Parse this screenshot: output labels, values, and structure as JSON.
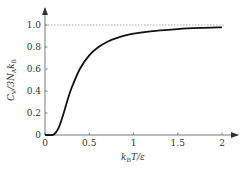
{
  "chart_data": {
    "type": "line",
    "title": "",
    "xlabel": "k_B T/ε",
    "ylabel": "C_V/3N_A k_B",
    "xlim": [
      0,
      2
    ],
    "ylim": [
      0,
      1.0
    ],
    "xticks": [
      0,
      0.5,
      1,
      1.5,
      2
    ],
    "xtick_labels": [
      "0",
      "0.5",
      "1",
      "1.5",
      "2"
    ],
    "yticks": [
      0,
      0.2,
      0.4,
      0.6,
      0.8,
      1.0
    ],
    "ytick_labels": [
      "0",
      "0.2",
      "0.4",
      "0.6",
      "0.8",
      "1.0"
    ],
    "grid": false,
    "reference_line": {
      "y": 1.0,
      "style": "dotted"
    },
    "series": [
      {
        "name": "heat capacity",
        "x": [
          0,
          0.05,
          0.1,
          0.15,
          0.2,
          0.25,
          0.3,
          0.4,
          0.5,
          0.6,
          0.7,
          0.8,
          1.0,
          1.25,
          1.5,
          1.75,
          2.0
        ],
        "y": [
          0,
          0.0,
          0.005,
          0.057,
          0.171,
          0.304,
          0.427,
          0.609,
          0.724,
          0.797,
          0.846,
          0.879,
          0.921,
          0.947,
          0.963,
          0.973,
          0.979
        ]
      }
    ]
  },
  "labels": {
    "xlabel_main": "k",
    "xlabel_sub": "B",
    "xlabel_rest": "T/ε",
    "ylabel_main": "C",
    "ylabel_sub1": "V",
    "ylabel_mid": "/3N",
    "ylabel_sub2": "A",
    "ylabel_k": "k",
    "ylabel_sub3": "B"
  }
}
